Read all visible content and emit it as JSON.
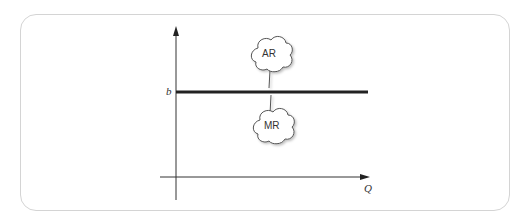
{
  "diagram": {
    "type": "economics-demand-curve",
    "y_axis_label": "",
    "x_axis_label": "Q",
    "price_label": "b",
    "callouts": [
      {
        "id": "ar",
        "label": "AR"
      },
      {
        "id": "mr",
        "label": "MR"
      }
    ],
    "colors": {
      "frame": "#d4d4d4",
      "axes": "#333333",
      "line": "#222222",
      "cloud_stroke": "#555555"
    }
  }
}
